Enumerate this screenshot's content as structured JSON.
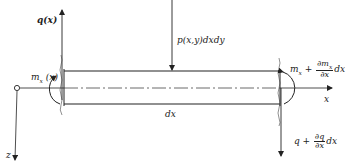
{
  "figure": {
    "type": "free-body diagram of beam/plate element",
    "labels": {
      "q_left": "q(x)",
      "moment_left": "m",
      "moment_left_sub": "x",
      "moment_left_arg": " (x)",
      "load": "p(x,y)dxdy",
      "moment_right_base": "m",
      "moment_right_sub": "x",
      "moment_right_plus": "+",
      "moment_right_num": "∂m",
      "moment_right_num_sub": "x",
      "moment_right_den": "∂x",
      "moment_right_tail": "dx",
      "shear_right_base": "q +",
      "shear_right_num": "∂q",
      "shear_right_den": "∂x",
      "shear_right_tail": "dx",
      "element_length": "dx",
      "x_axis": "x",
      "z_axis": "z"
    },
    "colors": {
      "line": "#222222",
      "background": "#ffffff"
    }
  }
}
